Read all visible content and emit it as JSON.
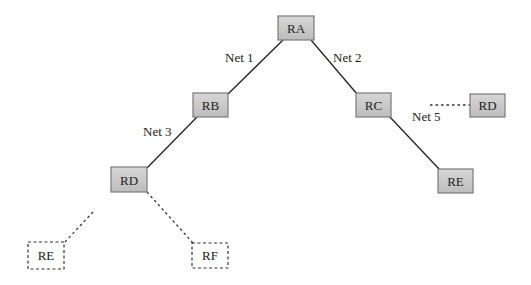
{
  "diagram": {
    "colors": {
      "node_fill": "#c9c9c9",
      "node_border": "#7a7a7a",
      "line": "#222222",
      "dashed_border": "#333333"
    },
    "nodes": [
      {
        "id": "RA",
        "label": "RA",
        "style": "solid"
      },
      {
        "id": "RB",
        "label": "RB",
        "style": "solid"
      },
      {
        "id": "RC",
        "label": "RC",
        "style": "solid"
      },
      {
        "id": "RD1",
        "label": "RD",
        "style": "solid"
      },
      {
        "id": "RD2",
        "label": "RD",
        "style": "solid"
      },
      {
        "id": "RE1",
        "label": "RE",
        "style": "solid"
      },
      {
        "id": "RE2",
        "label": "RE",
        "style": "dashed"
      },
      {
        "id": "RF",
        "label": "RF",
        "style": "dashed"
      }
    ],
    "links": [
      {
        "from": "RA",
        "to": "RB",
        "label": "Net 1",
        "style": "solid"
      },
      {
        "from": "RA",
        "to": "RC",
        "label": "Net 2",
        "style": "solid"
      },
      {
        "from": "RB",
        "to": "RD1",
        "label": "Net 3",
        "style": "solid"
      },
      {
        "from": "RC",
        "to": "RE1",
        "label": "Net 5",
        "style": "solid"
      },
      {
        "from": "RC",
        "to": "RD2",
        "label": "",
        "style": "dotted"
      },
      {
        "from": "RD1",
        "to": "RE2",
        "label": "",
        "style": "dotted"
      },
      {
        "from": "RD1",
        "to": "RF",
        "label": "",
        "style": "dotted"
      }
    ]
  }
}
